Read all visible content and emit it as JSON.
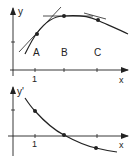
{
  "diagram": {
    "title": "",
    "top_graph": {
      "y_axis_label": "y",
      "x_axis_label": "x",
      "x_tick_label": "1",
      "point_labels": [
        "A",
        "B",
        "C"
      ],
      "description": "Concave curve y(x) with tangent lines drawn at points A, B, C; tangent at B is horizontal"
    },
    "bottom_graph": {
      "y_axis_label": "y'",
      "x_axis_label": "x",
      "x_tick_label": "1",
      "description": "Derivative y'(x): decreasing curve, positive at A, zero at B, negative at C"
    },
    "colors": {
      "ink": "#222222",
      "background": "#ffffff"
    }
  }
}
